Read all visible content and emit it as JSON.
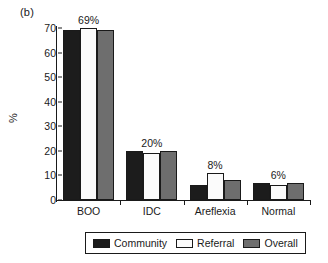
{
  "panel_label": "(b)",
  "chart_data": {
    "type": "bar",
    "title": "",
    "subtitle": "",
    "xlabel": "",
    "ylabel": "%",
    "ylim": [
      0,
      70
    ],
    "yticks": [
      0,
      10,
      20,
      30,
      40,
      50,
      60,
      70
    ],
    "ytick_labels": [
      "0",
      "10",
      "20",
      "30",
      "40",
      "50",
      "60",
      "70"
    ],
    "grid": false,
    "legend_position": "bottom",
    "categories": [
      "BOO",
      "IDC",
      "Areflexia",
      "Normal"
    ],
    "series": [
      {
        "name": "Community",
        "color": "#1c1c1c",
        "values": [
          69,
          20,
          6,
          7
        ]
      },
      {
        "name": "Referral",
        "color": "#fbfbfb",
        "values": [
          70,
          19,
          11,
          6
        ]
      },
      {
        "name": "Overall",
        "color": "#6e6e6e",
        "values": [
          69,
          20,
          8,
          7
        ]
      }
    ],
    "annotations": [
      "69%",
      "20%",
      "8%",
      "6%"
    ]
  },
  "legend": {
    "items": [
      {
        "label": "Community"
      },
      {
        "label": "Referral"
      },
      {
        "label": "Overall"
      }
    ]
  }
}
